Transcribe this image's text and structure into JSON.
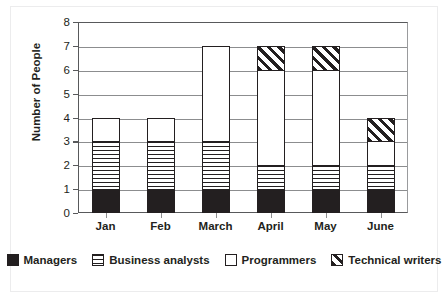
{
  "chart_data": {
    "type": "bar",
    "subtype": "stacked-bar",
    "title": "",
    "xlabel": "",
    "ylabel": "Number of People",
    "categories": [
      "Jan",
      "Feb",
      "March",
      "April",
      "May",
      "June"
    ],
    "series": [
      {
        "name": "Managers",
        "pattern": "solid-black",
        "values": [
          1,
          1,
          1,
          1,
          1,
          1
        ]
      },
      {
        "name": "Business analysts",
        "pattern": "horizontal-lines",
        "values": [
          2,
          2,
          2,
          1,
          1,
          1
        ]
      },
      {
        "name": "Programmers",
        "pattern": "white-empty",
        "values": [
          1,
          1,
          4,
          4,
          4,
          1
        ]
      },
      {
        "name": "Technical writers",
        "pattern": "diagonal-hatch",
        "values": [
          0,
          0,
          0,
          1,
          1,
          1
        ]
      }
    ],
    "totals": [
      4,
      4,
      7,
      7,
      7,
      4
    ],
    "ylim": [
      0,
      8
    ],
    "ytick_labels": [
      "0",
      "1",
      "2",
      "3",
      "4",
      "5",
      "6",
      "7",
      "8"
    ],
    "ytick_values": [
      0,
      1,
      2,
      3,
      4,
      5,
      6,
      7,
      8
    ],
    "grid": true,
    "grid_axis": "y",
    "legend_position": "bottom",
    "colors": {
      "managers": "#231f20",
      "business_analysts": "#ffffff",
      "programmers": "#ffffff",
      "technical_writers": "#ffffff",
      "ink": "#231f20",
      "gridline": "#8c8d8f",
      "axis": "#58595b",
      "background": "#ffffff"
    }
  },
  "legend": {
    "items": [
      {
        "label": "Managers",
        "icon": "solid-square-swatch"
      },
      {
        "label": "Business analysts",
        "icon": "striped-square-swatch"
      },
      {
        "label": "Programmers",
        "icon": "empty-square-swatch"
      },
      {
        "label": "Technical writers",
        "icon": "hatched-square-swatch"
      }
    ]
  }
}
